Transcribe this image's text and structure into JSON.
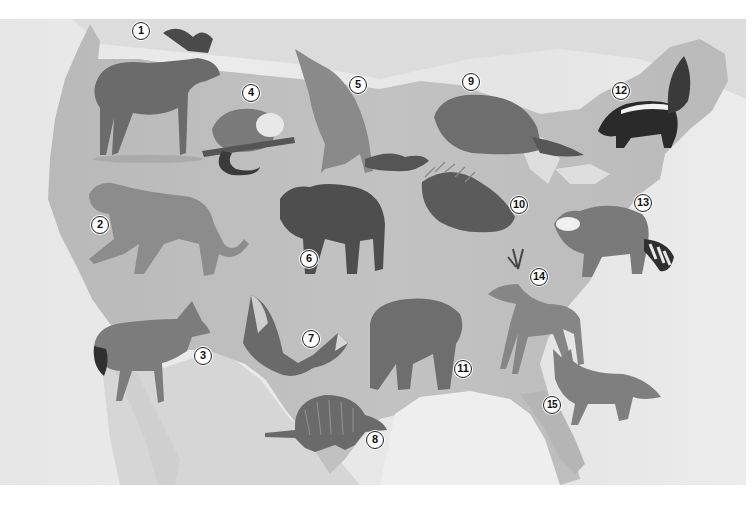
{
  "figure": {
    "colors": {
      "background": "#e8e8e8",
      "land": "#bdbdbd",
      "water_light": "#e2e2e2",
      "label_fill": "#ffffff",
      "label_border": "#1a1a1a"
    },
    "labels": [
      {
        "n": "1",
        "animal": "moose"
      },
      {
        "n": "2",
        "animal": "cougar"
      },
      {
        "n": "3",
        "animal": "coyote"
      },
      {
        "n": "4",
        "animal": "opossum"
      },
      {
        "n": "5",
        "animal": "gray wolf"
      },
      {
        "n": "6",
        "animal": "bison"
      },
      {
        "n": "7",
        "animal": "bat"
      },
      {
        "n": "8",
        "animal": "armadillo"
      },
      {
        "n": "9",
        "animal": "beaver"
      },
      {
        "n": "10",
        "animal": "porcupine"
      },
      {
        "n": "11",
        "animal": "grizzly bear"
      },
      {
        "n": "12",
        "animal": "skunk"
      },
      {
        "n": "13",
        "animal": "raccoon"
      },
      {
        "n": "14",
        "animal": "white-tailed deer"
      },
      {
        "n": "15",
        "animal": "gray fox"
      }
    ]
  }
}
